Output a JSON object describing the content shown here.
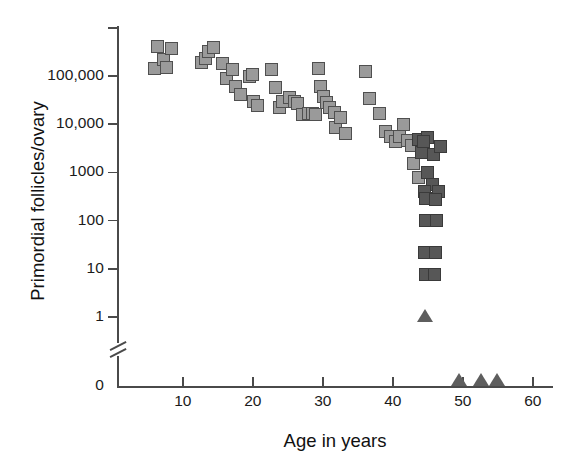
{
  "chart_data": {
    "type": "scatter",
    "title": "",
    "xlabel": "Age in years",
    "ylabel": "Primordial follicles/ovary",
    "yscale": "log",
    "xlim": [
      0,
      60
    ],
    "ylim": [
      1,
      1000000
    ],
    "grid": false,
    "legend": "none",
    "y_axis_break": true,
    "y_axis_break_note": "axis broken between 1 and 0",
    "xticks": [
      10,
      20,
      30,
      40,
      50,
      60
    ],
    "xtick_labels": [
      "10",
      "20",
      "30",
      "40",
      "50",
      "60"
    ],
    "yticks": [
      1,
      10,
      100,
      1000,
      10000,
      100000,
      1000000
    ],
    "ytick_labels": [
      "1",
      "10",
      "100",
      "1000",
      "10,000",
      "100,000",
      ""
    ],
    "zero_tick_label": "0",
    "series": [
      {
        "name": "light-square",
        "marker": "square",
        "color": "#9a9a9a",
        "edge_color": "#4f4f4f",
        "points": [
          [
            5.9,
            145000
          ],
          [
            6.4,
            400000
          ],
          [
            7.3,
            215000
          ],
          [
            7.6,
            150000
          ],
          [
            8.4,
            370000
          ],
          [
            12.6,
            190000
          ],
          [
            13.2,
            235000
          ],
          [
            13.7,
            330000
          ],
          [
            14.4,
            390000
          ],
          [
            15.7,
            180000
          ],
          [
            16.2,
            88000
          ],
          [
            17.1,
            135000
          ],
          [
            17.5,
            62000
          ],
          [
            18.3,
            42000
          ],
          [
            19.5,
            100000
          ],
          [
            19.9,
            105000
          ],
          [
            20.1,
            30000
          ],
          [
            20.6,
            24000
          ],
          [
            22.6,
            135000
          ],
          [
            23.2,
            58000
          ],
          [
            23.8,
            22000
          ],
          [
            24.3,
            30000
          ],
          [
            25.3,
            36000
          ],
          [
            25.9,
            30000
          ],
          [
            26.4,
            27000
          ],
          [
            27.1,
            16000
          ],
          [
            27.9,
            17000
          ],
          [
            28.5,
            16500
          ],
          [
            29.0,
            16000
          ],
          [
            29.4,
            140000
          ],
          [
            29.7,
            60000
          ],
          [
            30.1,
            37000
          ],
          [
            30.5,
            28000
          ],
          [
            30.9,
            22000
          ],
          [
            31.6,
            17500
          ],
          [
            31.8,
            8500
          ],
          [
            32.5,
            14000
          ],
          [
            33.2,
            6500
          ],
          [
            36.1,
            125000
          ],
          [
            36.7,
            34000
          ],
          [
            38.1,
            17000
          ],
          [
            38.9,
            7200
          ],
          [
            39.6,
            5500
          ],
          [
            40.4,
            4300
          ],
          [
            40.9,
            5600
          ],
          [
            41.5,
            9800
          ],
          [
            42.1,
            4700
          ],
          [
            42.7,
            3700
          ],
          [
            42.9,
            1500
          ],
          [
            43.6,
            780
          ]
        ]
      },
      {
        "name": "dark-square",
        "marker": "square",
        "color": "#575757",
        "edge_color": "#3a3a3a",
        "points": [
          [
            43.6,
            4900
          ],
          [
            44.9,
            5400
          ],
          [
            44.1,
            2600
          ],
          [
            45.8,
            2400
          ],
          [
            44.4,
            4300
          ],
          [
            46.8,
            3500
          ],
          [
            44.9,
            1000
          ],
          [
            45.6,
            560
          ],
          [
            44.5,
            410
          ],
          [
            46.5,
            400
          ],
          [
            44.7,
            290
          ],
          [
            46.1,
            270
          ],
          [
            44.6,
            100
          ],
          [
            46.2,
            100
          ],
          [
            44.5,
            22
          ],
          [
            46.1,
            22
          ],
          [
            44.6,
            7.5
          ],
          [
            46.0,
            7.5
          ]
        ]
      },
      {
        "name": "triangle",
        "marker": "triangle",
        "color": "#5e5e5e",
        "points": [
          [
            44.6,
            0.8
          ],
          [
            49.5,
            0
          ],
          [
            52.6,
            0
          ],
          [
            54.9,
            0
          ]
        ]
      }
    ]
  },
  "axes": {
    "y_title": "Primordial follicles/ovary",
    "x_title": "Age in years"
  }
}
